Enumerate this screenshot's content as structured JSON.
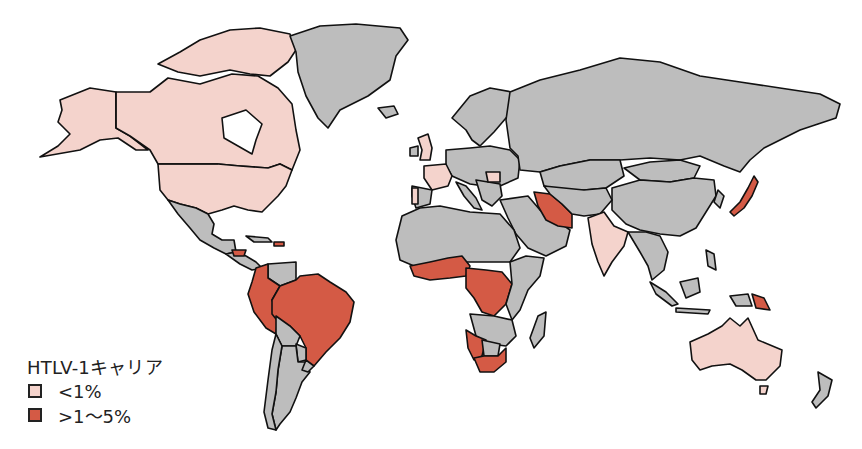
{
  "colors": {
    "ocean": "#ffffff",
    "no_data": "#bdbdbd",
    "low": "#f4d3cc",
    "high": "#d45a45",
    "outline": "#111111"
  },
  "legend": {
    "title": "HTLV-1キャリア",
    "items": [
      {
        "label": "<1%",
        "color": "#f4d3cc"
      },
      {
        "label": ">1～5%",
        "color": "#d45a45"
      }
    ]
  },
  "regions": {
    "low": [
      "Canada",
      "United States",
      "Alaska",
      "France",
      "United Kingdom",
      "Spain",
      "Portugal",
      "Romania",
      "India",
      "Australia"
    ],
    "high": [
      "Brazil",
      "Peru",
      "Colombia",
      "Ecuador",
      "Guyana",
      "Suriname",
      "French Guiana",
      "Honduras",
      "Dominican Republic",
      "Iran",
      "Japan",
      "Papua New Guinea",
      "Nigeria",
      "Cameroon",
      "Gabon",
      "Congo",
      "DR Congo",
      "Ghana",
      "Côte d'Ivoire",
      "Liberia",
      "Benin",
      "Togo",
      "Equatorial Guinea",
      "Namibia",
      "South Africa"
    ],
    "no_data": [
      "Greenland",
      "Russia",
      "China",
      "Mongolia",
      "Kazakhstan",
      "Mexico",
      "Argentina",
      "Chile",
      "Bolivia",
      "Paraguay",
      "Venezuela",
      "Northern Africa",
      "Middle East",
      "Southeast Asia",
      "Indonesia",
      "New Zealand",
      "Madagascar",
      "Scandinavia",
      "Central Europe"
    ]
  }
}
